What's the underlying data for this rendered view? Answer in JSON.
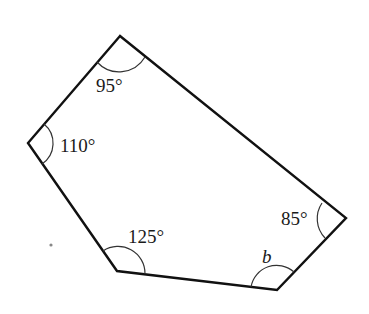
{
  "diagram": {
    "type": "pentagon-angles",
    "vertices": [
      {
        "id": "top",
        "x": 120,
        "y": 36
      },
      {
        "id": "left",
        "x": 28,
        "y": 143
      },
      {
        "id": "bottom-left",
        "x": 117,
        "y": 271
      },
      {
        "id": "bottom-right",
        "x": 277,
        "y": 290
      },
      {
        "id": "right",
        "x": 346,
        "y": 218
      }
    ],
    "angles": [
      {
        "vertex": "top",
        "label": "95°"
      },
      {
        "vertex": "left",
        "label": "110°"
      },
      {
        "vertex": "bottom-left",
        "label": "125°"
      },
      {
        "vertex": "bottom-right",
        "label": "b"
      },
      {
        "vertex": "right",
        "label": "85°"
      }
    ],
    "colors": {
      "edge": "#111111",
      "arc": "#333333",
      "text": "#1a1a1a",
      "background": "#ffffff"
    }
  }
}
